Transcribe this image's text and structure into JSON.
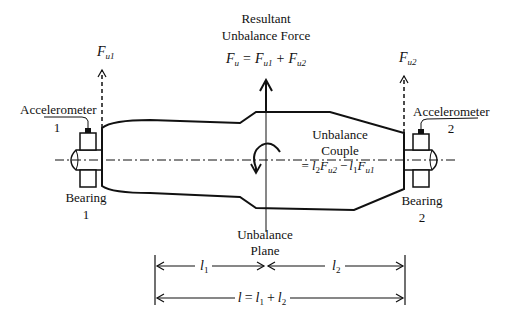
{
  "figure": {
    "title_resultant": [
      "Resultant",
      "Unbalance Force"
    ],
    "resultant_equation": {
      "lhs": "F",
      "lhs_sub": "u",
      "eq": "=",
      "t1": "F",
      "t1_sub": "u1",
      "plus": "+",
      "t2": "F",
      "t2_sub": "u2"
    },
    "force_left": {
      "symbol": "F",
      "sub": "u1"
    },
    "force_right": {
      "symbol": "F",
      "sub": "u2"
    },
    "accelerometer_left": {
      "label": "Accelerometer",
      "num": "1"
    },
    "accelerometer_right": {
      "label": "Accelerometer",
      "num": "2"
    },
    "bearing_left": {
      "label": "Bearing",
      "num": "1"
    },
    "bearing_right": {
      "label": "Bearing",
      "num": "2"
    },
    "couple": {
      "lines": [
        "Unbalance",
        "Couple"
      ],
      "eq": "=",
      "a": "l",
      "a_sub": "2",
      "b": "F",
      "b_sub": "u2",
      "minus": "−",
      "c": "l",
      "c_sub": "1",
      "d": "F",
      "d_sub": "u1"
    },
    "plane": {
      "lines": [
        "Unbalance",
        "Plane"
      ]
    },
    "dimensions": {
      "l1": {
        "symbol": "l",
        "sub": "1"
      },
      "l2": {
        "symbol": "l",
        "sub": "2"
      },
      "total": {
        "symbol": "l",
        "eq": "=",
        "a": "l",
        "a_sub": "1",
        "plus": "+",
        "b": "l",
        "b_sub": "2"
      }
    },
    "colors": {
      "stroke": "#111111",
      "background": "#ffffff"
    }
  }
}
